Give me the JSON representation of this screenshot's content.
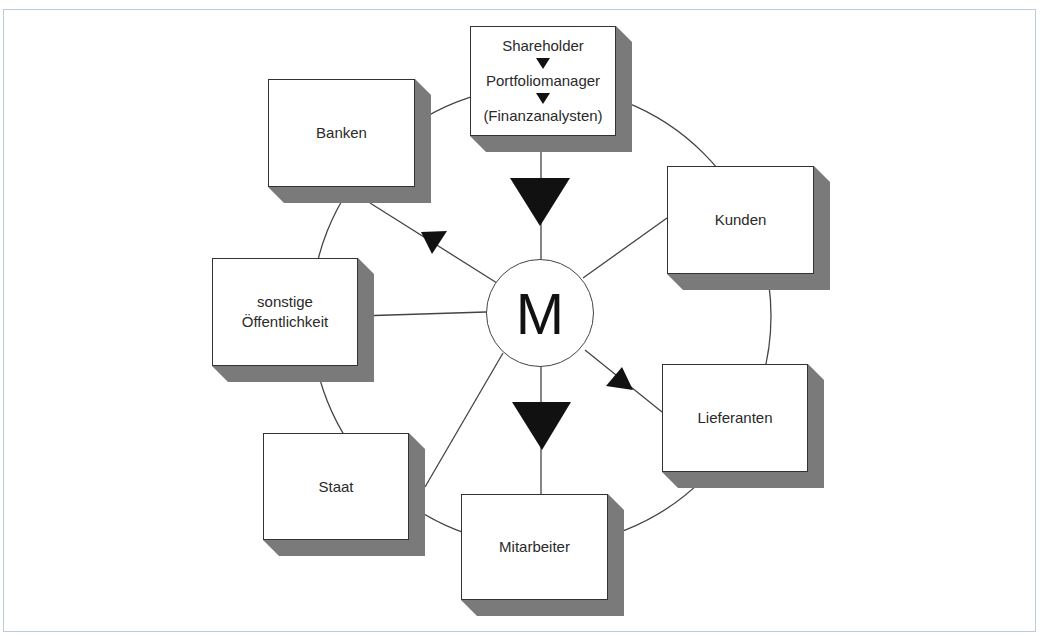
{
  "diagram": {
    "center": {
      "label": "M"
    },
    "top_box": {
      "lines": [
        "Shareholder",
        "Portfoliomanager",
        "(Finanzanalysten)"
      ],
      "arrow_icon": "down-triangle"
    },
    "stakeholders": {
      "banken": "Banken",
      "kunden": "Kunden",
      "sonstige_line1": "sonstige",
      "sonstige_line2": "Öffentlichkeit",
      "lieferanten": "Lieferanten",
      "staat": "Staat",
      "mitarbeiter": "Mitarbeiter"
    },
    "colors": {
      "frame": "#b9cbe0",
      "shadow": "#7a7a7a",
      "line": "#444444",
      "arrow": "#111111"
    }
  }
}
